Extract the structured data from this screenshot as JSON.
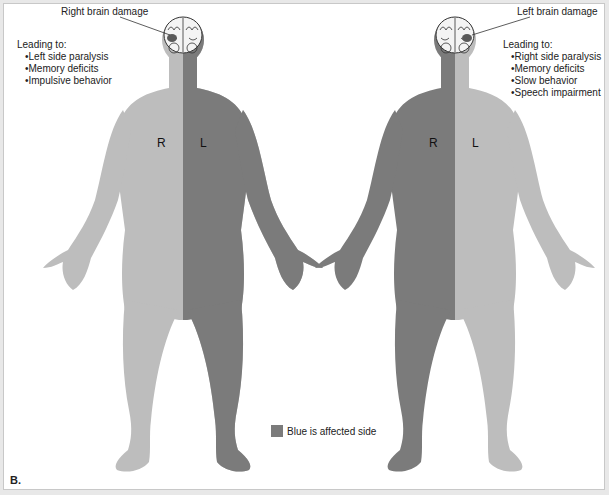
{
  "colors": {
    "unaffected": "#bdbdbd",
    "affected": "#7b7b7b",
    "lesion": "#5a5a5a",
    "text": "#222222"
  },
  "left_figure": {
    "title": "Right brain damage",
    "leading_label": "Leading to:",
    "effects": [
      "Left side paralysis",
      "Memory deficits",
      "Impulsive behavior"
    ],
    "side_labels": {
      "r": "R",
      "l": "L"
    },
    "affected_side": "L"
  },
  "right_figure": {
    "title": "Left brain damage",
    "leading_label": "Leading to:",
    "effects": [
      "Right side paralysis",
      "Memory deficits",
      "Slow behavior",
      "Speech impairment"
    ],
    "side_labels": {
      "r": "R",
      "l": "L"
    },
    "affected_side": "R"
  },
  "legend": {
    "label": "Blue is affected side"
  },
  "panel_label": "B."
}
